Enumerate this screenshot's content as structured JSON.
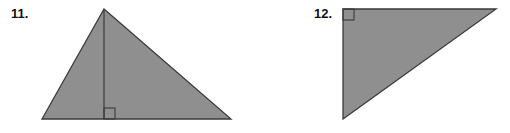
{
  "problems": [
    {
      "number": "11.",
      "shape": "triangle-with-altitude",
      "fill": "#8f8f8f",
      "stroke": "#3a3a3a",
      "vertices": [
        [
          104,
          9
        ],
        [
          42,
          119
        ],
        [
          231,
          119
        ]
      ],
      "altitude": [
        [
          104,
          9
        ],
        [
          104,
          119
        ]
      ],
      "right_angle_box": {
        "x": 104,
        "y": 108,
        "size": 11
      }
    },
    {
      "number": "12.",
      "shape": "right-triangle",
      "fill": "#8f8f8f",
      "stroke": "#3a3a3a",
      "vertices": [
        [
          343,
          9
        ],
        [
          496,
          9
        ],
        [
          343,
          119
        ]
      ],
      "right_angle_box": {
        "x": 343,
        "y": 9,
        "size": 11
      }
    }
  ]
}
